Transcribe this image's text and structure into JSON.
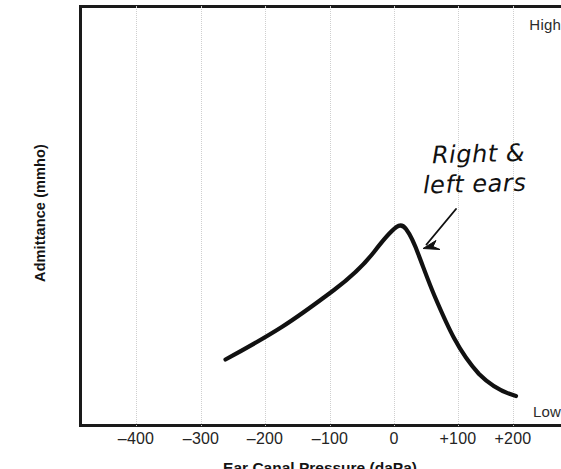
{
  "figure": {
    "type": "tympanogram",
    "y_axis": {
      "title": "Admittance (mmho)",
      "high_label": "High",
      "low_label": "Low"
    },
    "x_axis": {
      "title": "Ear Canal Pressure (daPa)",
      "tick_labels": [
        "–400",
        "–300",
        "–200",
        "–100",
        "0",
        "+100",
        "+200"
      ]
    },
    "annotation": {
      "line1": "Right &",
      "line2": "left ears"
    },
    "colors": {
      "curve": "#111111",
      "axis": "#1a1a1a",
      "gridline": "#cfcfcf",
      "background": "#ffffff"
    }
  },
  "chart_data": {
    "type": "line",
    "title": "",
    "xlabel": "Ear Canal Pressure (daPa)",
    "ylabel": "Admittance (mmho)",
    "xlim": [
      -500,
      230
    ],
    "ylim": [
      0,
      1
    ],
    "grid": true,
    "legend": "none",
    "xticks": [
      -400,
      -300,
      -200,
      -100,
      0,
      100,
      200
    ],
    "xticklabels": [
      "–400",
      "–300",
      "–200",
      "–100",
      "0",
      "+100",
      "+200"
    ],
    "yticks": [
      0,
      1
    ],
    "yticklabels": [
      "Low",
      "High"
    ],
    "annotations": [
      {
        "text": "Right & left ears",
        "points_to_x": 45,
        "points_to_y": 0.42,
        "label_x": 105,
        "label_y": 0.68
      }
    ],
    "series": [
      {
        "name": "Right & left ears",
        "x": [
          -260,
          -240,
          -220,
          -200,
          -180,
          -160,
          -140,
          -120,
          -100,
          -80,
          -60,
          -40,
          -20,
          0,
          6,
          20,
          35,
          50,
          65,
          80,
          100,
          120,
          140,
          160,
          180,
          200,
          210
        ],
        "y": [
          0.162,
          0.181,
          0.2,
          0.221,
          0.243,
          0.266,
          0.29,
          0.316,
          0.345,
          0.382,
          0.424,
          0.468,
          0.508,
          0.538,
          0.542,
          0.533,
          0.5,
          0.44,
          0.363,
          0.287,
          0.2,
          0.15,
          0.122,
          0.105,
          0.094,
          0.088,
          0.086
        ]
      }
    ]
  },
  "geometry": {
    "gridline_x": [
      136,
      201,
      265,
      330,
      394,
      458,
      513
    ],
    "tick_label_x": [
      136,
      201,
      265,
      330,
      394,
      458,
      513
    ],
    "curve_path": "M 225.5,359.5 C 243,350 262,339.5 281,327.5 C 300,315.5 318,302 334,290 C 350,278 363,266 374,252 C 382,241.5 389,232.5 396.5,227 C 400,224.5 403,225 406,229 C 411,235.5 415,245 419,256 C 424,269 429,283 435,297 C 441,311 447,325 454,338 C 461,351 469,363 479,374 C 490,385 503,392.5 516,396",
    "arrow_path": "M 456,210 L 425,246",
    "arrow_head": "M 425,247.5 L 434.5,241.5 L 431,249.5 L 437,253 Z"
  }
}
